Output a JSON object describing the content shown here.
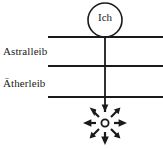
{
  "diagram": {
    "background_color": "#ffffff",
    "stroke_color": "#1a1a1a",
    "ich": {
      "label": "Ich",
      "shape": "circle",
      "center_x": 105,
      "center_y": 20,
      "radius": 17
    },
    "labels": [
      {
        "name": "astralleib",
        "text": "Astralleib"
      },
      {
        "name": "aetherleib",
        "text": "Ätherleib"
      }
    ],
    "horizontal_lines": [
      {
        "name": "line-top",
        "y": 37,
        "x1": 48,
        "x2": 163
      },
      {
        "name": "line-middle",
        "y": 66,
        "x1": 48,
        "x2": 163
      },
      {
        "name": "line-bottom",
        "y": 97,
        "x1": 48,
        "x2": 163
      }
    ],
    "vertical_axis": {
      "name": "central-axis",
      "x": 105,
      "y1": 37,
      "y2": 110
    },
    "radiance": {
      "name": "radiating-star",
      "center_x": 105,
      "center_y": 123,
      "inner_radius": 4,
      "arrow_count": 8,
      "arrow_length": 19,
      "description": "eight arrows radiating outward from small open circle"
    }
  }
}
